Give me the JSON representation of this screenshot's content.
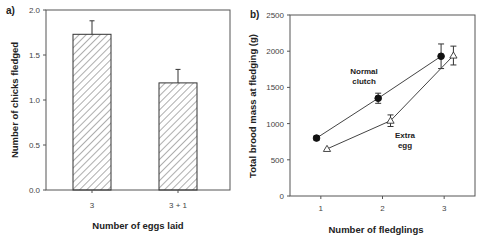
{
  "chart_data": [
    {
      "panel": "a)",
      "type": "bar",
      "title": "",
      "xlabel": "Number of eggs laid",
      "ylabel": "Number of chicks fledged",
      "categories": [
        "3",
        "3 + 1"
      ],
      "values": [
        1.73,
        1.19
      ],
      "errors": [
        0.15,
        0.15
      ],
      "ylim": [
        0.0,
        2.0
      ],
      "yticks": [
        "0.0",
        "0.5",
        "1.0",
        "1.5",
        "2.0"
      ],
      "bar_fill": "diagonal hatch",
      "grid": false,
      "legend": null
    },
    {
      "panel": "b)",
      "type": "line",
      "title": "",
      "xlabel": "Number of fledglings",
      "ylabel": "Total brood mass at fledging (g)",
      "xticks": [
        "1",
        "2",
        "3"
      ],
      "yticks": [
        "0",
        "500",
        "1000",
        "1500",
        "2000",
        "2500"
      ],
      "ylim": [
        0,
        2500
      ],
      "xlim": [
        0.5,
        3.5
      ],
      "grid": false,
      "series": [
        {
          "name": "Normal clutch",
          "marker": "filled circle",
          "x": [
            0.93,
            1.93,
            2.95
          ],
          "values": [
            800,
            1350,
            1930
          ],
          "errors": [
            30,
            70,
            170
          ]
        },
        {
          "name": "Extra egg",
          "marker": "open triangle",
          "x": [
            1.1,
            2.13,
            3.15
          ],
          "values": [
            650,
            1040,
            1940
          ],
          "errors": [
            0,
            80,
            130
          ]
        }
      ],
      "annotations": [
        "Normal clutch",
        "Extra egg"
      ]
    }
  ]
}
